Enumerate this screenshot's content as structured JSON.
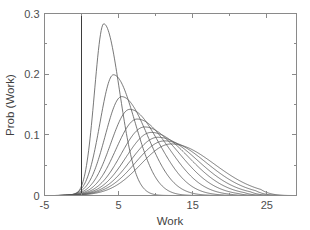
{
  "figure": {
    "background_color": "#ffffff",
    "axis_color": "#8a8a8a",
    "curve_color": "#555555",
    "marker_line_color": "#3d3d3d"
  },
  "chart_data": {
    "type": "line",
    "title": "",
    "xlabel": "Work",
    "ylabel": "Prob (Work)",
    "xlim": [
      -5,
      29
    ],
    "ylim": [
      0,
      0.3
    ],
    "xticks": [
      -5,
      5,
      15,
      25
    ],
    "xtick_labels": [
      "-5",
      "5",
      "15",
      "25"
    ],
    "xticks_minor": [
      0,
      10,
      20
    ],
    "yticks": [
      0,
      0.1,
      0.2,
      0.3
    ],
    "ytick_labels": [
      "0",
      "0.1",
      "0.2",
      "0.3"
    ],
    "yticks_minor": [
      0.05,
      0.15,
      0.25
    ],
    "grid": false,
    "legend": null,
    "annotations": [
      {
        "name": "zero-work-reference-line",
        "type": "vertical-line",
        "x": 0,
        "label": ""
      }
    ],
    "series": [
      {
        "name": "curve-1",
        "peak_x": 3.0,
        "peak_y": 0.283,
        "onset_x": -3.6,
        "tail_end_x": 12.5,
        "shape": {
          "mode": 3.0,
          "rise": 1.25,
          "decay": 2.05
        }
      },
      {
        "name": "curve-2",
        "peak_x": 4.3,
        "peak_y": 0.199,
        "onset_x": -3.7,
        "tail_end_x": 15.5,
        "shape": {
          "mode": 4.3,
          "rise": 1.8,
          "decay": 2.8
        }
      },
      {
        "name": "curve-3",
        "peak_x": 5.4,
        "peak_y": 0.163,
        "onset_x": -3.8,
        "tail_end_x": 17.5,
        "shape": {
          "mode": 5.4,
          "rise": 2.2,
          "decay": 3.35
        }
      },
      {
        "name": "curve-4",
        "peak_x": 6.5,
        "peak_y": 0.142,
        "onset_x": -3.9,
        "tail_end_x": 19.0,
        "shape": {
          "mode": 6.5,
          "rise": 2.55,
          "decay": 3.8
        }
      },
      {
        "name": "curve-5",
        "peak_x": 7.5,
        "peak_y": 0.126,
        "onset_x": -4.0,
        "tail_end_x": 20.2,
        "shape": {
          "mode": 7.5,
          "rise": 2.85,
          "decay": 4.2
        }
      },
      {
        "name": "curve-6",
        "peak_x": 8.5,
        "peak_y": 0.113,
        "onset_x": -4.0,
        "tail_end_x": 21.2,
        "shape": {
          "mode": 8.5,
          "rise": 3.15,
          "decay": 4.55
        }
      },
      {
        "name": "curve-7",
        "peak_x": 9.4,
        "peak_y": 0.104,
        "onset_x": -4.1,
        "tail_end_x": 22.0,
        "shape": {
          "mode": 9.4,
          "rise": 3.4,
          "decay": 4.85
        }
      },
      {
        "name": "curve-8",
        "peak_x": 10.3,
        "peak_y": 0.096,
        "onset_x": -4.1,
        "tail_end_x": 22.8,
        "shape": {
          "mode": 10.3,
          "rise": 3.65,
          "decay": 5.1
        }
      },
      {
        "name": "curve-9",
        "peak_x": 11.2,
        "peak_y": 0.09,
        "onset_x": -4.2,
        "tail_end_x": 23.5,
        "shape": {
          "mode": 11.2,
          "rise": 3.9,
          "decay": 5.35
        }
      },
      {
        "name": "curve-10",
        "peak_x": 12.1,
        "peak_y": 0.085,
        "onset_x": -4.2,
        "tail_end_x": 24.2,
        "shape": {
          "mode": 12.1,
          "rise": 4.1,
          "decay": 5.6
        }
      }
    ]
  }
}
